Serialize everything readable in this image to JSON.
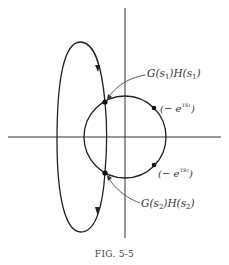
{
  "figure": {
    "caption": "FIG. 5-5",
    "labels": {
      "point1": {
        "G": "G(s",
        "sub1": "1",
        "mid": ")H(s",
        "sub2": "1",
        "end": ")"
      },
      "point2": {
        "G": "G(s",
        "sub1": "2",
        "mid": ")H(s",
        "sub2": "2",
        "end": ")"
      },
      "marker1": {
        "pre": "(− e",
        "sup": "τs₁",
        "end": ")"
      },
      "marker2": {
        "pre": "(− e",
        "sup": "τs₂",
        "end": ")"
      }
    },
    "colors": {
      "stroke": "#222222",
      "background": "#ffffff"
    }
  }
}
